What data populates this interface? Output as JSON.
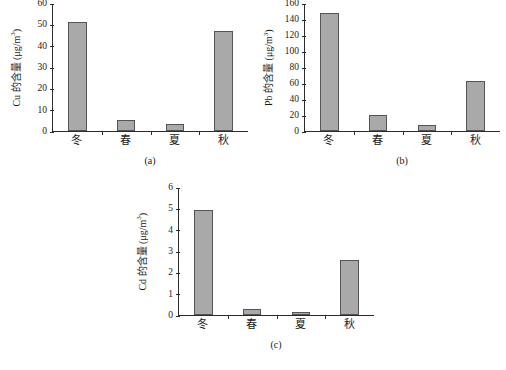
{
  "figure": {
    "panels": [
      {
        "id": "a",
        "caption": "(a)",
        "ylabel_prefix": "Cu 的含量 (μg/m",
        "ylabel_sup": "3",
        "ylabel_suffix": ")",
        "ylabel_full": "Cu 的含量 (μg/m³)"
      },
      {
        "id": "b",
        "caption": "(b)",
        "ylabel_prefix": "Pb 的含量 (μg/m",
        "ylabel_sup": "3",
        "ylabel_suffix": ")",
        "ylabel_full": "Pb 的含量 (μg/m³)"
      },
      {
        "id": "c",
        "caption": "(c)",
        "ylabel_prefix": "Cd 的含量 (μg/m",
        "ylabel_sup": "3",
        "ylabel_suffix": ")",
        "ylabel_full": "Cd 的含量 (μg/m³)"
      }
    ]
  },
  "chart_data": [
    {
      "type": "bar",
      "title": "(a)",
      "xlabel": "",
      "ylabel": "Cu 的含量 (μg/m³)",
      "categories": [
        "冬",
        "春",
        "夏",
        "秋"
      ],
      "category_names_en": [
        "Winter",
        "Spring",
        "Summer",
        "Autumn"
      ],
      "values": [
        51,
        5,
        3.5,
        47
      ],
      "ylim": [
        0,
        60
      ],
      "yticks": [
        0,
        10,
        20,
        30,
        40,
        50,
        60
      ],
      "grid": false,
      "legend": "none",
      "bar_color": "#a9a9a9",
      "bar_edge_color": "#555555"
    },
    {
      "type": "bar",
      "title": "(b)",
      "xlabel": "",
      "ylabel": "Pb 的含量 (μg/m³)",
      "categories": [
        "冬",
        "春",
        "夏",
        "秋"
      ],
      "category_names_en": [
        "Winter",
        "Spring",
        "Summer",
        "Autumn"
      ],
      "values": [
        147,
        20.5,
        7,
        63
      ],
      "ylim": [
        0,
        160
      ],
      "yticks": [
        0,
        20,
        40,
        60,
        80,
        100,
        120,
        140,
        160
      ],
      "grid": false,
      "legend": "none",
      "bar_color": "#a9a9a9",
      "bar_edge_color": "#555555"
    },
    {
      "type": "bar",
      "title": "(c)",
      "xlabel": "",
      "ylabel": "Cd 的含量 (μg/m³)",
      "categories": [
        "冬",
        "春",
        "夏",
        "秋"
      ],
      "category_names_en": [
        "Winter",
        "Spring",
        "Summer",
        "Autumn"
      ],
      "values": [
        4.9,
        0.3,
        0.15,
        2.6
      ],
      "ylim": [
        0,
        6
      ],
      "yticks": [
        0,
        1,
        2,
        3,
        4,
        5,
        6
      ],
      "grid": false,
      "legend": "none",
      "bar_color": "#a9a9a9",
      "bar_edge_color": "#555555"
    }
  ]
}
